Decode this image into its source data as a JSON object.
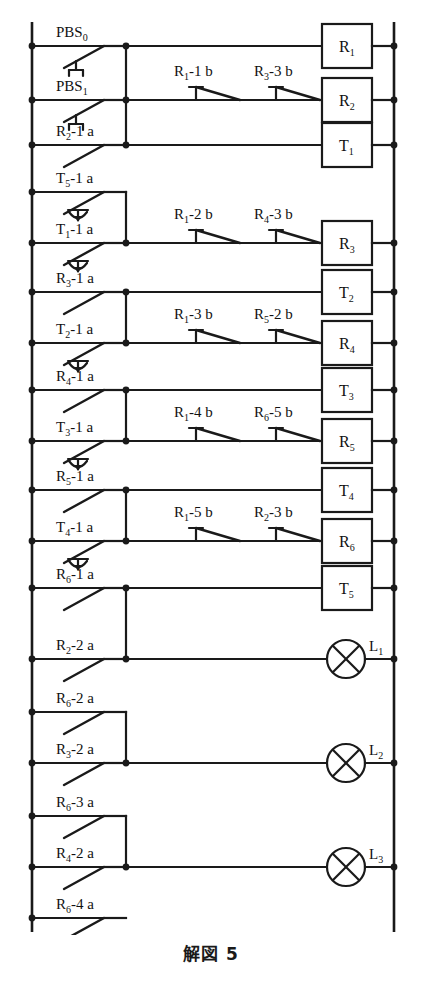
{
  "figure": {
    "caption": "解図 5",
    "type": "ladder-logic-diagram",
    "background": "#ffffff",
    "line_color": "#1a1a1a"
  },
  "rails": {
    "left_label": "left-power-rail",
    "right_label": "right-power-rail"
  },
  "rungs": [
    {
      "id": "rung-1",
      "left_contact": {
        "name": "PBS",
        "sub": "0",
        "suffix": "",
        "kind": "pushbutton-nc"
      },
      "series_contacts": [],
      "output": {
        "label": "R",
        "sub": "1",
        "shape": "box"
      }
    },
    {
      "id": "rung-2",
      "left_contact": {
        "name": "PBS",
        "sub": "1",
        "suffix": "",
        "kind": "pushbutton-no"
      },
      "series_contacts": [
        {
          "name": "R",
          "sub": "1",
          "suffix": "-1 b",
          "kind": "nc"
        },
        {
          "name": "R",
          "sub": "3",
          "suffix": "-3 b",
          "kind": "nc"
        }
      ],
      "output": {
        "label": "R",
        "sub": "2",
        "shape": "box"
      }
    },
    {
      "id": "rung-3",
      "left_contact": {
        "name": "R",
        "sub": "2",
        "suffix": "-1 a",
        "kind": "no"
      },
      "series_contacts": [],
      "output": {
        "label": "T",
        "sub": "1",
        "shape": "box"
      }
    },
    {
      "id": "rung-4",
      "left_contact": {
        "name": "T",
        "sub": "5",
        "suffix": "-1 a",
        "kind": "timer-no"
      },
      "series_contacts": [],
      "output": null
    },
    {
      "id": "rung-5",
      "left_contact": {
        "name": "T",
        "sub": "1",
        "suffix": "-1 a",
        "kind": "timer-no"
      },
      "series_contacts": [
        {
          "name": "R",
          "sub": "1",
          "suffix": "-2 b",
          "kind": "nc"
        },
        {
          "name": "R",
          "sub": "4",
          "suffix": "-3 b",
          "kind": "nc"
        }
      ],
      "output": {
        "label": "R",
        "sub": "3",
        "shape": "box"
      }
    },
    {
      "id": "rung-6",
      "left_contact": {
        "name": "R",
        "sub": "3",
        "suffix": "-1 a",
        "kind": "no"
      },
      "series_contacts": [],
      "output": {
        "label": "T",
        "sub": "2",
        "shape": "box"
      }
    },
    {
      "id": "rung-7",
      "left_contact": {
        "name": "T",
        "sub": "2",
        "suffix": "-1 a",
        "kind": "timer-no"
      },
      "series_contacts": [
        {
          "name": "R",
          "sub": "1",
          "suffix": "-3 b",
          "kind": "nc"
        },
        {
          "name": "R",
          "sub": "5",
          "suffix": "-2 b",
          "kind": "nc"
        }
      ],
      "output": {
        "label": "R",
        "sub": "4",
        "shape": "box"
      }
    },
    {
      "id": "rung-8",
      "left_contact": {
        "name": "R",
        "sub": "4",
        "suffix": "-1 a",
        "kind": "no"
      },
      "series_contacts": [],
      "output": {
        "label": "T",
        "sub": "3",
        "shape": "box"
      }
    },
    {
      "id": "rung-9",
      "left_contact": {
        "name": "T",
        "sub": "3",
        "suffix": "-1 a",
        "kind": "timer-no"
      },
      "series_contacts": [
        {
          "name": "R",
          "sub": "1",
          "suffix": "-4 b",
          "kind": "nc"
        },
        {
          "name": "R",
          "sub": "6",
          "suffix": "-5 b",
          "kind": "nc"
        }
      ],
      "output": {
        "label": "R",
        "sub": "5",
        "shape": "box"
      }
    },
    {
      "id": "rung-10",
      "left_contact": {
        "name": "R",
        "sub": "5",
        "suffix": "-1 a",
        "kind": "no"
      },
      "series_contacts": [],
      "output": {
        "label": "T",
        "sub": "4",
        "shape": "box"
      }
    },
    {
      "id": "rung-11",
      "left_contact": {
        "name": "T",
        "sub": "4",
        "suffix": "-1 a",
        "kind": "timer-no"
      },
      "series_contacts": [
        {
          "name": "R",
          "sub": "1",
          "suffix": "-5 b",
          "kind": "nc"
        },
        {
          "name": "R",
          "sub": "2",
          "suffix": "-3 b",
          "kind": "nc"
        }
      ],
      "output": {
        "label": "R",
        "sub": "6",
        "shape": "box"
      }
    },
    {
      "id": "rung-12",
      "left_contact": {
        "name": "R",
        "sub": "6",
        "suffix": "-1 a",
        "kind": "no"
      },
      "series_contacts": [],
      "output": {
        "label": "T",
        "sub": "5",
        "shape": "box"
      }
    },
    {
      "id": "rung-13",
      "left_contact": {
        "name": "R",
        "sub": "2",
        "suffix": "-2 a",
        "kind": "no"
      },
      "series_contacts": [],
      "output": {
        "label": "L",
        "sub": "1",
        "shape": "lamp"
      }
    },
    {
      "id": "rung-14",
      "left_contact": {
        "name": "R",
        "sub": "6",
        "suffix": "-2 a",
        "kind": "no"
      },
      "series_contacts": [],
      "output": null
    },
    {
      "id": "rung-15",
      "left_contact": {
        "name": "R",
        "sub": "3",
        "suffix": "-2 a",
        "kind": "no"
      },
      "series_contacts": [],
      "output": {
        "label": "L",
        "sub": "2",
        "shape": "lamp"
      }
    },
    {
      "id": "rung-16",
      "left_contact": {
        "name": "R",
        "sub": "6",
        "suffix": "-3 a",
        "kind": "no"
      },
      "series_contacts": [],
      "output": null
    },
    {
      "id": "rung-17",
      "left_contact": {
        "name": "R",
        "sub": "4",
        "suffix": "-2 a",
        "kind": "no"
      },
      "series_contacts": [],
      "output": {
        "label": "L",
        "sub": "3",
        "shape": "lamp"
      }
    },
    {
      "id": "rung-18",
      "left_contact": {
        "name": "R",
        "sub": "6",
        "suffix": "-4 a",
        "kind": "no"
      },
      "series_contacts": [],
      "output": null
    }
  ]
}
